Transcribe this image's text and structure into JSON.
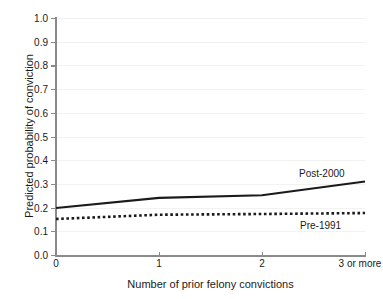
{
  "chart_data": {
    "type": "line",
    "title": "",
    "subtitle": "",
    "xlabel": "Number of prior felony convictions",
    "ylabel": "Predicted probability of conviction",
    "categories": [
      "0",
      "1",
      "2",
      "3 or more"
    ],
    "x": [
      0,
      1,
      2,
      3
    ],
    "xlim": [
      0,
      3
    ],
    "ylim": [
      0.0,
      1.0
    ],
    "yticks": [
      "1.0",
      "0.9",
      "0.8",
      "0.7",
      "0.6",
      "0.5",
      "0.4",
      "0.3",
      "0.2",
      "0.1",
      "0.0"
    ],
    "ytick_values": [
      1.0,
      0.9,
      0.8,
      0.7,
      0.6,
      0.5,
      0.4,
      0.3,
      0.2,
      0.1,
      0.0
    ],
    "grid": true,
    "legend_position": "inline-annotation",
    "series": [
      {
        "name": "Post-2000",
        "style": "solid",
        "color": "#1a1a1a",
        "values": [
          0.198,
          0.241,
          0.252,
          0.31
        ]
      },
      {
        "name": "Pre-1991",
        "style": "dotted",
        "color": "#1a1a1a",
        "values": [
          0.152,
          0.17,
          0.173,
          0.177
        ]
      }
    ],
    "annotations": [
      {
        "text": "Post-2000",
        "series": "Post-2000"
      },
      {
        "text": "Pre-1991",
        "series": "Pre-1991"
      }
    ]
  },
  "axes": {
    "y_title": "Predicted probability of conviction",
    "x_title": "Number of prior felony convictions",
    "y_labels": [
      "1.0",
      "0.9",
      "0.8",
      "0.7",
      "0.6",
      "0.5",
      "0.4",
      "0.3",
      "0.2",
      "0.1",
      "0.0"
    ],
    "x_labels": [
      "0",
      "1",
      "2",
      "3 or more"
    ]
  },
  "series_labels": {
    "post_2000": "Post-2000",
    "pre_1991": "Pre-1991"
  },
  "colors": {
    "line": "#1a1a1a",
    "axis": "#8a8a8a",
    "grid": "#f2f2f2",
    "background": "#ffffff"
  }
}
